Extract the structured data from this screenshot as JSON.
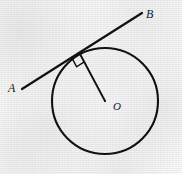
{
  "figure": {
    "background_color": "#f4f4f4",
    "stroke_color": "#111111",
    "labels": {
      "point_a": "A",
      "point_b": "B",
      "center_o": "O"
    },
    "circle": {
      "center_x": 105,
      "center_y": 101,
      "radius": 53,
      "stroke_width": 2.1
    },
    "tangent_line": {
      "name": "AB",
      "x1": 22,
      "y1": 89,
      "x2": 142,
      "y2": 13,
      "stroke_width": 2.2
    },
    "tangent_point": {
      "x": 80,
      "y": 54
    },
    "radius_segment": {
      "name": "OT",
      "x1": 80,
      "y1": 54,
      "x2": 105,
      "y2": 101,
      "stroke_width": 1.9
    },
    "right_angle_marker": {
      "size": 9,
      "stroke_width": 1.5,
      "angle_degrees": 90
    }
  }
}
